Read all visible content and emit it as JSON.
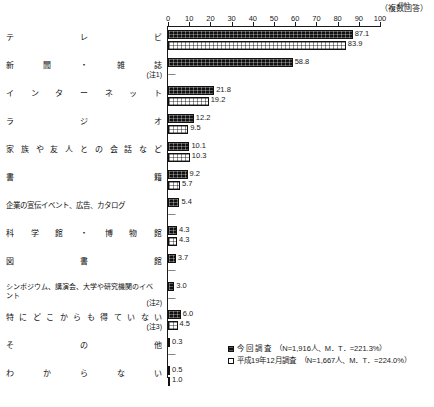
{
  "header": {
    "multiple_answer_note": "（複数回答）",
    "unit_label": "(%)"
  },
  "axis": {
    "ticks": [
      0,
      10,
      20,
      30,
      40,
      50,
      60,
      70,
      80,
      90,
      100
    ],
    "min": 0,
    "max": 100
  },
  "legend": [
    {
      "key": "current",
      "swatch": "filled-black-square",
      "label": "今 回 調 査",
      "meta": "（N=1,916人、M．T．=221.3%）"
    },
    {
      "key": "previous",
      "swatch": "open-white-square",
      "label": "平成19年12月調査",
      "meta": "（N=1,667人、M．T．=224.0%）"
    }
  ],
  "chart_data": {
    "type": "bar",
    "orientation": "horizontal",
    "title": "",
    "xlabel": "(%)",
    "ylabel": "",
    "xlim": [
      0,
      100
    ],
    "grid": false,
    "legend_position": "bottom-right",
    "annotations": [
      "（複数回答）"
    ],
    "categories": [
      "テレビ",
      "新聞・雑誌",
      "インターネット",
      "ラジオ",
      "家族や友人との会話など",
      "書籍",
      "企業の宣伝イベント、広告、カタログ",
      "科学館・博物館",
      "図書館",
      "シンポジウム、講演会、大学や研究機関のイベント",
      "特にどこからも得ていない",
      "その他",
      "わからない"
    ],
    "series": [
      {
        "name": "今 回 調 査",
        "values": [
          87.1,
          58.8,
          21.8,
          12.2,
          10.1,
          9.2,
          5.4,
          4.3,
          3.7,
          3.0,
          6.0,
          0.3,
          0.5
        ]
      },
      {
        "name": "平成19年12月調査",
        "values": [
          83.9,
          null,
          19.2,
          9.5,
          10.3,
          5.7,
          null,
          4.3,
          null,
          null,
          4.5,
          null,
          1.0
        ]
      }
    ]
  },
  "rows": [
    {
      "label_chars": "テレビ",
      "label_style": "spread",
      "note": "",
      "current": "87.1",
      "previous": "83.9"
    },
    {
      "label_chars": "新聞・雑誌",
      "label_style": "spread",
      "note": "(注1)",
      "current": "58.8",
      "previous": "—"
    },
    {
      "label_chars": "インターネット",
      "label_style": "spread",
      "note": "",
      "current": "21.8",
      "previous": "19.2"
    },
    {
      "label_chars": "ラジオ",
      "label_style": "spread",
      "note": "",
      "current": "12.2",
      "previous": "9.5"
    },
    {
      "label_chars": "家族や友人との会話など",
      "label_style": "spread",
      "note": "",
      "current": "10.1",
      "previous": "10.3"
    },
    {
      "label_chars": "書籍",
      "label_style": "spread",
      "note": "",
      "current": "9.2",
      "previous": "5.7"
    },
    {
      "label_chars": "企業の宣伝イベント、広告、カタログ",
      "label_style": "plain",
      "note": "",
      "current": "5.4",
      "previous": "—"
    },
    {
      "label_chars": "科学館・博物館",
      "label_style": "spread",
      "note": "",
      "current": "4.3",
      "previous": "4.3"
    },
    {
      "label_chars": "図書館",
      "label_style": "spread",
      "note": "",
      "current": "3.7",
      "previous": "—"
    },
    {
      "label_chars": "シンポジウム、講演会、大学や研究機関のイベント",
      "label_style": "wrap",
      "note": "(注2)",
      "current": "3.0",
      "previous": "—"
    },
    {
      "label_chars": "特にどこからも得ていない",
      "label_style": "spread",
      "note": "(注3)",
      "current": "6.0",
      "previous": "4.5"
    },
    {
      "label_chars": "その他",
      "label_style": "spread",
      "note": "",
      "current": "0.3",
      "previous": "—"
    },
    {
      "label_chars": "わからない",
      "label_style": "spread",
      "note": "",
      "current": "0.5",
      "previous": "1.0"
    }
  ]
}
